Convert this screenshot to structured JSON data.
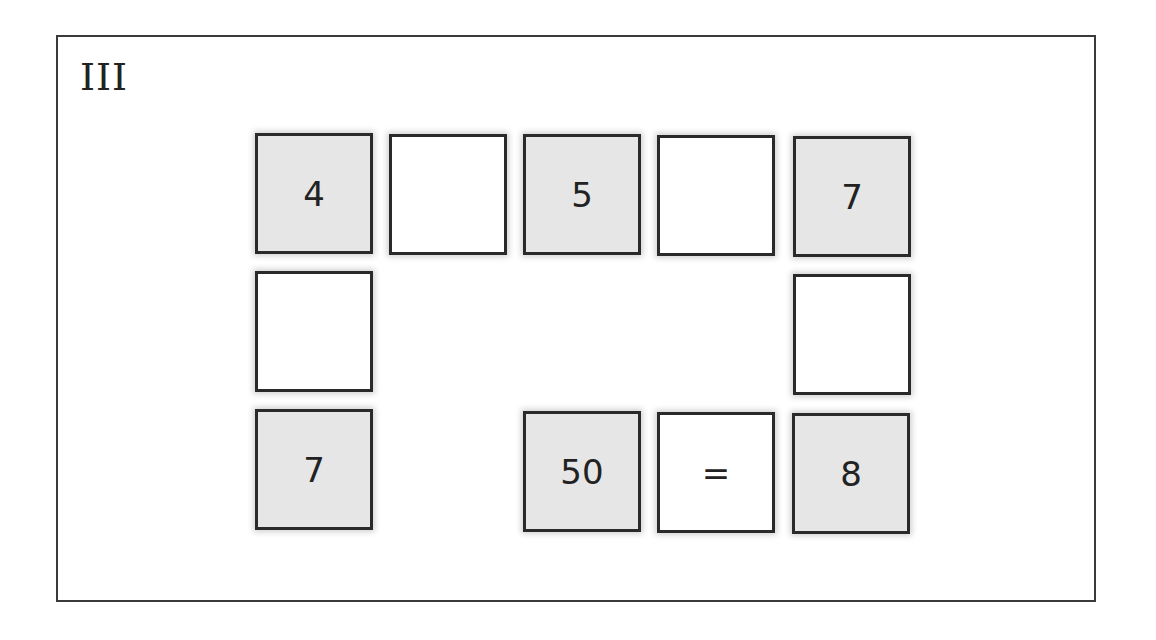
{
  "puzzle": {
    "label": "III",
    "colors": {
      "filled_tile": "#e6e6e6",
      "empty_tile": "#ffffff",
      "border": "#2a2a2a"
    },
    "tiles": [
      {
        "id": "r1c1",
        "value": "4",
        "filled": true,
        "x": 255,
        "y": 133
      },
      {
        "id": "r1c2",
        "value": "",
        "filled": false,
        "x": 389,
        "y": 134
      },
      {
        "id": "r1c3",
        "value": "5",
        "filled": true,
        "x": 523,
        "y": 134
      },
      {
        "id": "r1c4",
        "value": "",
        "filled": false,
        "x": 657,
        "y": 135
      },
      {
        "id": "r1c5",
        "value": "7",
        "filled": true,
        "x": 793,
        "y": 136
      },
      {
        "id": "r2c1",
        "value": "",
        "filled": false,
        "x": 255,
        "y": 271
      },
      {
        "id": "r2c5",
        "value": "",
        "filled": false,
        "x": 793,
        "y": 274
      },
      {
        "id": "r3c1",
        "value": "7",
        "filled": true,
        "x": 255,
        "y": 409
      },
      {
        "id": "r3c3",
        "value": "50",
        "filled": true,
        "x": 523,
        "y": 411
      },
      {
        "id": "r3c4",
        "value": "=",
        "filled": false,
        "x": 657,
        "y": 412
      },
      {
        "id": "r3c5",
        "value": "8",
        "filled": true,
        "x": 792,
        "y": 413
      }
    ]
  }
}
